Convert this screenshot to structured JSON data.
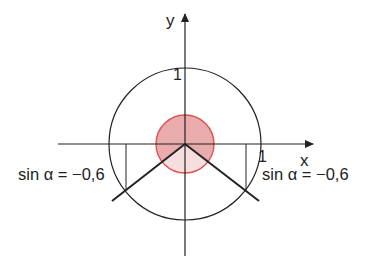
{
  "diagram": {
    "type": "unit-circle",
    "axes": {
      "x_label": "x",
      "y_label": "y",
      "x_tick_label": "1",
      "y_tick_label": "1"
    },
    "annotations": {
      "left": "sin α = −0,6",
      "right": "sin α = −0,6"
    },
    "values": {
      "sin_alpha": -0.6,
      "points": [
        {
          "quadrant": "III",
          "cos": -0.8,
          "sin": -0.6
        },
        {
          "quadrant": "IV",
          "cos": 0.8,
          "sin": -0.6
        }
      ]
    },
    "colors": {
      "line": "#222222",
      "angle_stroke": "#d9534f",
      "angle_fill_dark": "#e6a3a3",
      "angle_fill_light": "#f6dcdc"
    }
  }
}
